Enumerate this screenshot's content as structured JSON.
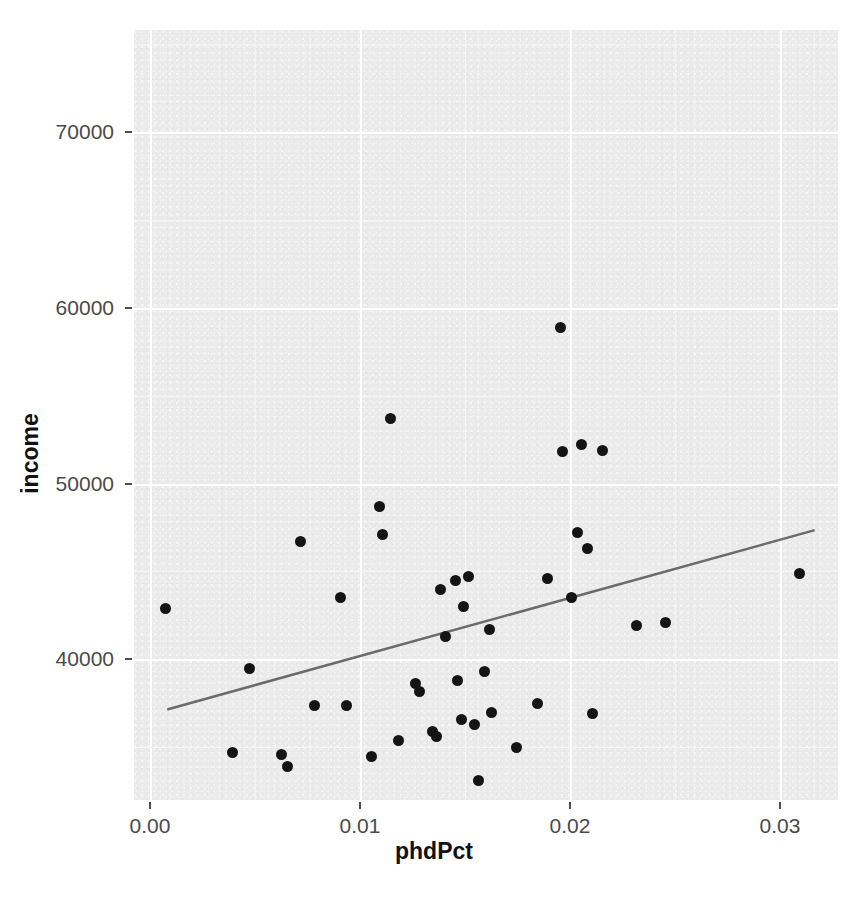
{
  "chart_data": {
    "type": "scatter",
    "title": "",
    "xlabel": "phdPct",
    "ylabel": "income",
    "xlim": [
      -0.00076,
      0.03276
    ],
    "ylim": [
      32000,
      75800
    ],
    "xticks": [
      0.0,
      0.01,
      0.02,
      0.03
    ],
    "xtick_labels": [
      "0.00",
      "0.01",
      "0.02",
      "0.03"
    ],
    "yticks": [
      40000,
      50000,
      60000,
      70000
    ],
    "ytick_labels": [
      "40000",
      "50000",
      "60000",
      "70000"
    ],
    "grid": true,
    "grid_major_color": "#ffffff",
    "panel_color": "#ebebeb",
    "point_color": "#141414",
    "line_color": "#6b6b6b",
    "legend": "none",
    "points": [
      {
        "x": 0.00073,
        "y": 42900
      },
      {
        "x": 0.00395,
        "y": 34700
      },
      {
        "x": 0.00475,
        "y": 39500
      },
      {
        "x": 0.00625,
        "y": 34600
      },
      {
        "x": 0.00655,
        "y": 33900
      },
      {
        "x": 0.00715,
        "y": 46700
      },
      {
        "x": 0.00785,
        "y": 37400
      },
      {
        "x": 0.00905,
        "y": 43500
      },
      {
        "x": 0.00935,
        "y": 37400
      },
      {
        "x": 0.01055,
        "y": 34500
      },
      {
        "x": 0.01095,
        "y": 48700
      },
      {
        "x": 0.01105,
        "y": 47100
      },
      {
        "x": 0.01145,
        "y": 53700
      },
      {
        "x": 0.01185,
        "y": 35400
      },
      {
        "x": 0.01265,
        "y": 38600
      },
      {
        "x": 0.01285,
        "y": 38200
      },
      {
        "x": 0.01345,
        "y": 35900
      },
      {
        "x": 0.01365,
        "y": 35600
      },
      {
        "x": 0.01385,
        "y": 44000
      },
      {
        "x": 0.01405,
        "y": 41300
      },
      {
        "x": 0.01455,
        "y": 44500
      },
      {
        "x": 0.01465,
        "y": 38800
      },
      {
        "x": 0.01485,
        "y": 36600
      },
      {
        "x": 0.01495,
        "y": 43000
      },
      {
        "x": 0.01515,
        "y": 44700
      },
      {
        "x": 0.01545,
        "y": 36300
      },
      {
        "x": 0.01565,
        "y": 33100
      },
      {
        "x": 0.01595,
        "y": 39300
      },
      {
        "x": 0.01615,
        "y": 41700
      },
      {
        "x": 0.01625,
        "y": 37000
      },
      {
        "x": 0.01745,
        "y": 35000
      },
      {
        "x": 0.01845,
        "y": 37500
      },
      {
        "x": 0.01895,
        "y": 44600
      },
      {
        "x": 0.01955,
        "y": 58900
      },
      {
        "x": 0.01965,
        "y": 51800
      },
      {
        "x": 0.02005,
        "y": 43500
      },
      {
        "x": 0.02035,
        "y": 47200
      },
      {
        "x": 0.02055,
        "y": 52200
      },
      {
        "x": 0.02085,
        "y": 46300
      },
      {
        "x": 0.02105,
        "y": 36900
      },
      {
        "x": 0.02155,
        "y": 51900
      },
      {
        "x": 0.02315,
        "y": 41900
      },
      {
        "x": 0.02455,
        "y": 42100
      },
      {
        "x": 0.03095,
        "y": 44900
      }
    ],
    "fit_line": {
      "name": "linear fit",
      "x": [
        0.00082,
        0.03165
      ],
      "y": [
        37150,
        47350
      ]
    }
  },
  "axis": {
    "x_title": "phdPct",
    "y_title": "income"
  }
}
